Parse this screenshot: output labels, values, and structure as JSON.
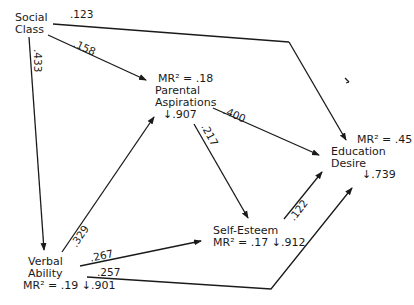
{
  "nodes": {
    "social_class": {
      "line1": "Social",
      "line2": "Class"
    },
    "parental": {
      "mr": "MR² = .18",
      "line1": "Parental",
      "line2": "Aspirations",
      "resid": "↓.907"
    },
    "education": {
      "mr": "MR² = .45",
      "line1": "Education",
      "line2": "Desire",
      "resid": "↓.739"
    },
    "self_esteem": {
      "line1": "Self-Esteem",
      "mr": "MR² = .17",
      "resid": "↓.912"
    },
    "verbal": {
      "line1": "Verbal",
      "line2": "Ability",
      "mr": "MR² = .19",
      "resid": "↓.901"
    }
  },
  "paths": [
    {
      "from": "Social Class",
      "to": "Education Desire",
      "coef": ".123"
    },
    {
      "from": "Social Class",
      "to": "Parental Aspirations",
      "coef": ".158"
    },
    {
      "from": "Social Class",
      "to": "Verbal Ability",
      "coef": ".433"
    },
    {
      "from": "Parental Aspirations",
      "to": "Education Desire",
      "coef": ".400"
    },
    {
      "from": "Parental Aspirations",
      "to": "Self-Esteem",
      "coef": ".217"
    },
    {
      "from": "Verbal Ability",
      "to": "Parental Aspirations",
      "coef": ".329"
    },
    {
      "from": "Verbal Ability",
      "to": "Self-Esteem",
      "coef": ".267"
    },
    {
      "from": "Verbal Ability",
      "to": "Education Desire",
      "coef": ".257"
    },
    {
      "from": "Self-Esteem",
      "to": "Education Desire",
      "coef": ".122"
    }
  ]
}
